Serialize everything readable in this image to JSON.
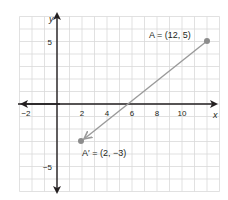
{
  "chart_data": {
    "type": "scatter",
    "title": "",
    "xlabel": "x",
    "ylabel": "y",
    "xlim": [
      -3,
      13
    ],
    "ylim": [
      -7,
      7
    ],
    "grid": true,
    "x_ticks": [
      -2,
      2,
      4,
      6,
      8,
      10
    ],
    "y_ticks": [
      5,
      -5
    ],
    "points": [
      {
        "name": "A",
        "x": 12,
        "y": 5,
        "label": "A = (12, 5)"
      },
      {
        "name": "A'",
        "x": 2,
        "y": -3,
        "label": "A' = (2, −3)"
      }
    ],
    "arrow": {
      "from": "A",
      "to": "A'"
    },
    "colors": {
      "grid": "#d9d9d9",
      "axis": "#231f20",
      "segment": "#9a9a9a",
      "point": "#8c8c8c"
    }
  },
  "labels": {
    "x_axis": "x",
    "y_axis": "y",
    "point_a": "A = (12, 5)",
    "point_a_prime": "A′ = (2, −3)",
    "tick_x_neg2": "−2",
    "tick_x_2": "2",
    "tick_x_4": "4",
    "tick_x_6": "6",
    "tick_x_8": "8",
    "tick_x_10": "10",
    "tick_y_5": "5",
    "tick_y_neg5": "−5"
  }
}
